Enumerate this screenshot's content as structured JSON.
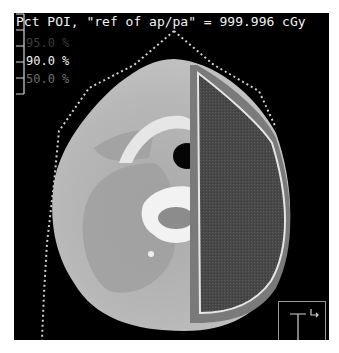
{
  "viewer": {
    "title": "Pct POI, \"ref of ap/pa\" = 999.996 cGy",
    "background_color": "#000000",
    "view_type": "axial CT slice (neck) with dose overlay"
  },
  "isodose_legend": [
    {
      "label": "95.0 %",
      "color": "#3a3a3a"
    },
    {
      "label": "90.0 %",
      "color": "#f0f0f0"
    },
    {
      "label": "50.0 %",
      "color": "#6e6e6e"
    }
  ],
  "overlay": {
    "target_structure_color": "#4a4a4a",
    "target_outline_color": "#e6e6e6",
    "beam_edge_band_color": "#7a7a7a",
    "body_contour_dots_color": "#cfcfcf"
  },
  "scale_bar": {
    "ticks": 6
  },
  "orientation_icon": {
    "glyph": "I",
    "arrow": "↳"
  }
}
